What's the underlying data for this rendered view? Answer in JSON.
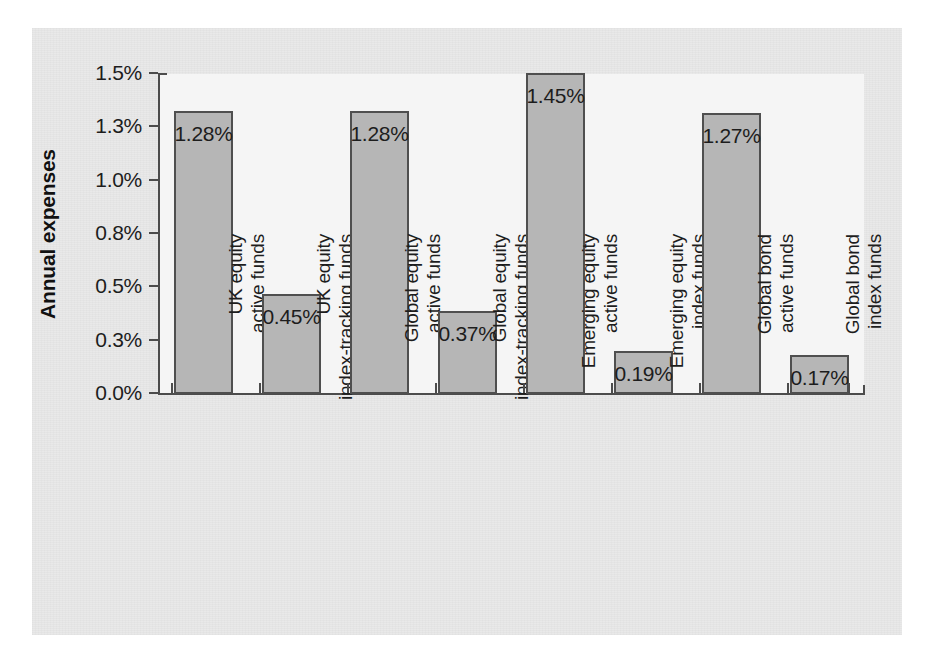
{
  "chart_data": {
    "type": "bar",
    "title": "",
    "subtitle": "",
    "xlabel": "",
    "ylabel": "Annual expenses",
    "grid": false,
    "legend": "none",
    "orientation": "vertical",
    "ylim": [
      0,
      1.5
    ],
    "y_tick_labels": [
      "1.5%",
      "1.3%",
      "1.0%",
      "0.8%",
      "0.5%",
      "0.3%",
      "0.0%"
    ],
    "y_tick_values": [
      1.5,
      1.3,
      1.0,
      0.8,
      0.5,
      0.3,
      0.0
    ],
    "categories": [
      "UK equity active funds",
      "UK equity index-tracking funds",
      "Global equity active funds",
      "Global equity index-tracking funds",
      "Emerging equity active funds",
      "Emerging equity index funds",
      "Global bond active funds",
      "Global bond index funds"
    ],
    "category_lines": [
      [
        "UK equity",
        "active funds"
      ],
      [
        "UK equity",
        "index-tracking funds"
      ],
      [
        "Global equity",
        "active funds"
      ],
      [
        "Global equity",
        "index-tracking funds"
      ],
      [
        "Emerging equity",
        "active funds"
      ],
      [
        "Emerging equity",
        "index funds"
      ],
      [
        "Global bond",
        "active funds"
      ],
      [
        "Global bond",
        "index funds"
      ]
    ],
    "values": [
      1.28,
      0.45,
      1.28,
      0.37,
      1.45,
      0.19,
      1.27,
      0.17
    ],
    "value_labels": [
      "1.28%",
      "0.45%",
      "1.28%",
      "0.37%",
      "1.45%",
      "0.19%",
      "1.27%",
      "0.17%"
    ],
    "colors": {
      "bar_fill": "#b6b6b6",
      "bar_border": "#4f4f4f",
      "axis": "#4c4c4c",
      "plot_background": "#f5f5f5",
      "page_background": "#e9e9e9",
      "text": "#1d1d1d"
    }
  }
}
